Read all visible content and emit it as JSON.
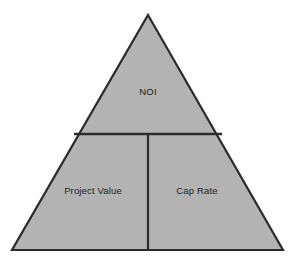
{
  "diagram": {
    "type": "pyramid",
    "shape": "triangle",
    "segment_count": 3,
    "background_color": "#ffffff",
    "fill_color": "#b3b3b3",
    "stroke_color": "#2b2b2b",
    "text_color": "#1d1d1d",
    "geometry": {
      "apex": {
        "x": 148,
        "y": 15
      },
      "bottom_left": {
        "x": 12,
        "y": 250
      },
      "bottom_right": {
        "x": 283,
        "y": 250
      },
      "horizontal_divider_y": 134,
      "horizontal_divider_x_start": 74,
      "horizontal_divider_x_end": 222,
      "vertical_divider_x": 148,
      "vertical_divider_y_start": 134,
      "vertical_divider_y_end": 250
    },
    "segments": [
      {
        "id": "top",
        "label": "NOI",
        "position": "apex",
        "center": {
          "x": 148,
          "y": 92
        }
      },
      {
        "id": "bottom-left",
        "label": "Project Value",
        "position": "base-left",
        "center": {
          "x": 93,
          "y": 191
        }
      },
      {
        "id": "bottom-right",
        "label": "Cap Rate",
        "position": "base-right",
        "center": {
          "x": 197,
          "y": 191
        }
      }
    ]
  }
}
